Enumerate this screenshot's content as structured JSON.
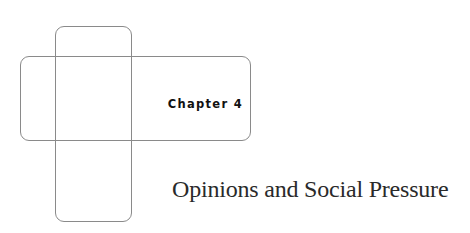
{
  "chapter": {
    "label": "Chapter 4",
    "title": "Opinions and Social Pressure"
  },
  "decoration": {
    "shapes": [
      "vertical-rounded-rect",
      "horizontal-rounded-rect"
    ],
    "stroke_color": "#8a8a8a"
  }
}
